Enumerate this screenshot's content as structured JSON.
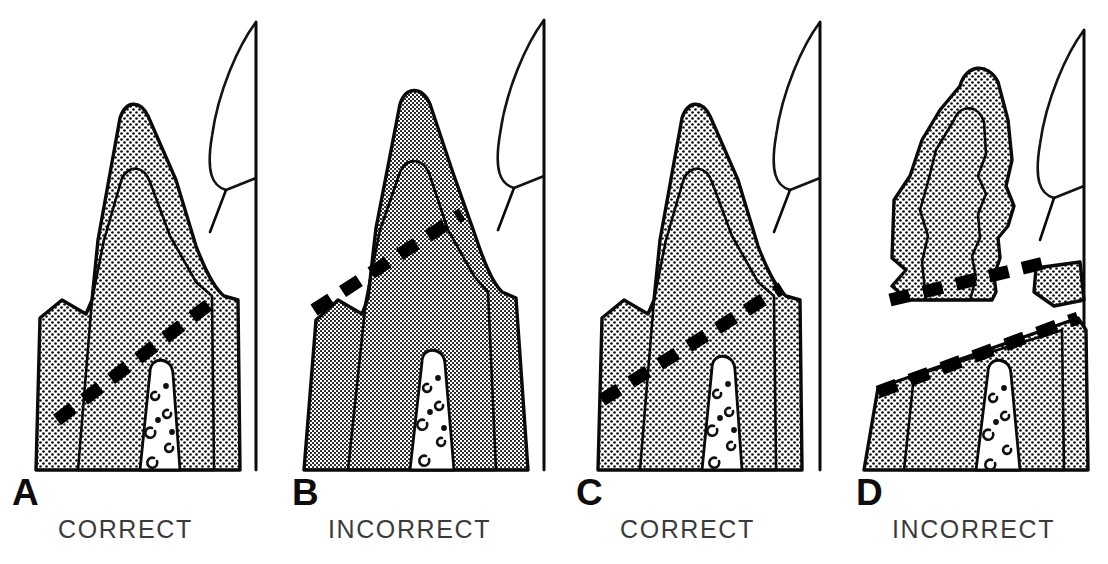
{
  "figure": {
    "background_color": "#ffffff",
    "ink_color": "#0a0a0a",
    "caption_color": "#3b3b3b",
    "panel_count": 4
  },
  "panels": [
    {
      "letter": "A",
      "caption": "CORRECT",
      "stipple": "coarse",
      "stipple_spacing_px": 6,
      "crown_shape": "pointed-cusp",
      "cut_lines": 1,
      "cut_description": "single oblique dashed preparation line running low across the crown",
      "fragments_separated": false
    },
    {
      "letter": "B",
      "caption": "INCORRECT",
      "stipple": "fine",
      "stipple_spacing_px": 4,
      "crown_shape": "pointed-cusp-narrow",
      "cut_lines": 1,
      "cut_description": "dashed line placed high near the cusp tip",
      "fragments_separated": false
    },
    {
      "letter": "C",
      "caption": "CORRECT",
      "stipple": "coarse",
      "stipple_spacing_px": 6,
      "crown_shape": "pointed-cusp",
      "cut_lines": 1,
      "cut_description": "single steep oblique dashed preparation line",
      "fragments_separated": false
    },
    {
      "letter": "D",
      "caption": "INCORRECT",
      "stipple": "coarse",
      "stipple_spacing_px": 6,
      "crown_shape": "irregular-lumpy",
      "cut_lines": 2,
      "cut_description": "two parallel dashed lines bounding a separated white wedge; a small fragment is detached at the right",
      "fragments_separated": true
    }
  ],
  "legend": {
    "stipple_meaning": "shaded tooth structure",
    "white_channel_meaning": "pulp canal",
    "dashed_line_meaning": "line of sectioning / preparation",
    "unshaded_outline_meaning": "adjacent tooth"
  }
}
